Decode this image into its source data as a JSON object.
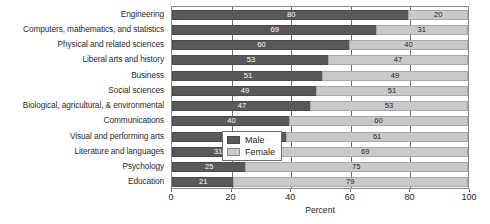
{
  "chart_data": {
    "type": "bar",
    "orientation": "horizontal",
    "stacked": true,
    "title": "",
    "xlabel": "Percent",
    "ylabel": "",
    "xlim": [
      0,
      100
    ],
    "xticks": [
      0,
      20,
      40,
      60,
      80,
      100
    ],
    "grid": true,
    "legend_position": "lower-right-inside",
    "categories": [
      "Engineering",
      "Computers, mathematics, and statistics",
      "Physical and related sciences",
      "Liberal arts and history",
      "Business",
      "Social sciences",
      "Biological, agricultural, & environmental",
      "Communications",
      "Visual and performing arts",
      "Literature and languages",
      "Psychology",
      "Education"
    ],
    "series": [
      {
        "name": "Male",
        "color": "#595959",
        "values": [
          80,
          69,
          60,
          53,
          51,
          49,
          47,
          40,
          39,
          31,
          25,
          21
        ]
      },
      {
        "name": "Female",
        "color": "#c9c9c9",
        "values": [
          20,
          31,
          40,
          47,
          49,
          51,
          53,
          60,
          61,
          69,
          75,
          79
        ]
      }
    ]
  },
  "legend": {
    "items": [
      {
        "label": "Male",
        "color": "#595959"
      },
      {
        "label": "Female",
        "color": "#c9c9c9"
      }
    ]
  },
  "axis": {
    "x_title": "Percent",
    "x_tick_labels": [
      "0",
      "20",
      "40",
      "60",
      "80",
      "100"
    ]
  }
}
